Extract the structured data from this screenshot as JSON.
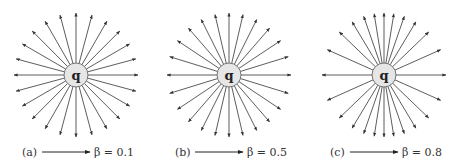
{
  "diagram": {
    "line_count": 24,
    "colors": {
      "line": "#333333",
      "charge_fill": "#e6e6e6",
      "charge_stroke": "#555555",
      "text": "#333333"
    },
    "panels": [
      {
        "id": "a",
        "label": "(a)",
        "charge_label": "q",
        "beta": 0.1,
        "beta_text": "β = 0.1"
      },
      {
        "id": "b",
        "label": "(b)",
        "charge_label": "q",
        "beta": 0.5,
        "beta_text": "β = 0.5"
      },
      {
        "id": "c",
        "label": "(c)",
        "charge_label": "q",
        "beta": 0.8,
        "beta_text": "β = 0.8"
      }
    ]
  }
}
